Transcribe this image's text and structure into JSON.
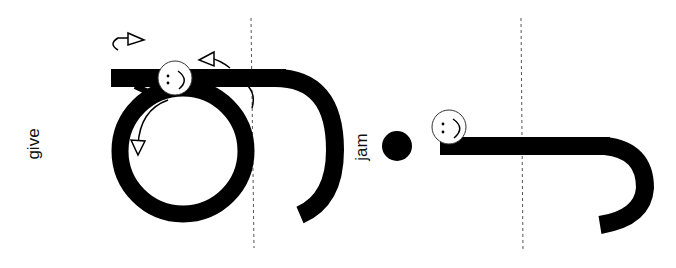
{
  "labels": {
    "left": "give",
    "middle": "jam"
  },
  "colors": {
    "ink": "#000000",
    "guide": "#555555",
    "background": "#ffffff"
  },
  "icons": [
    "smiley-start-marker",
    "direction-arrow",
    "dashed-guide-line"
  ]
}
